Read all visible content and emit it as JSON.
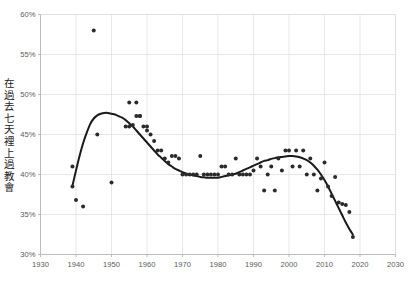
{
  "chart_data": {
    "type": "scatter",
    "title": "",
    "subtitle": "",
    "xlabel": "",
    "ylabel": "在過去七天裡上過教會",
    "xlim": [
      1930,
      2030
    ],
    "ylim": [
      30,
      60
    ],
    "xticks": [
      1930,
      1940,
      1950,
      1960,
      1970,
      1980,
      1990,
      2000,
      2010,
      2020,
      2030
    ],
    "xtick_labels": [
      "1930",
      "1940",
      "1950",
      "1960",
      "1970",
      "1980",
      "1990",
      "2000",
      "2010",
      "2020",
      "2030"
    ],
    "yticks": [
      30,
      35,
      40,
      45,
      50,
      55,
      60
    ],
    "ytick_labels": [
      "30%",
      "35%",
      "40%",
      "45%",
      "50%",
      "55%",
      "60%"
    ],
    "grid": true,
    "grid_color": "#dcdcdc",
    "legend": null,
    "legend_position": "none",
    "marker_color": "#2b2b2b",
    "marker_size": 2.0,
    "trend_color": "#1a1a1a",
    "trend_width": 2.0,
    "series": [
      {
        "name": "在過去七天裡上過教會",
        "type": "scatter",
        "points": [
          [
            1939,
            41.0
          ],
          [
            1939,
            38.5
          ],
          [
            1940,
            36.8
          ],
          [
            1942,
            36.0
          ],
          [
            1945,
            58.0
          ],
          [
            1946,
            45.0
          ],
          [
            1950,
            39.0
          ],
          [
            1954,
            46.0
          ],
          [
            1955,
            46.0
          ],
          [
            1955,
            49.0
          ],
          [
            1956,
            46.2
          ],
          [
            1957,
            49.0
          ],
          [
            1957,
            47.3
          ],
          [
            1958,
            47.3
          ],
          [
            1958,
            47.3
          ],
          [
            1959,
            46.0
          ],
          [
            1960,
            46.0
          ],
          [
            1960,
            45.5
          ],
          [
            1961,
            45.0
          ],
          [
            1962,
            44.2
          ],
          [
            1963,
            43.0
          ],
          [
            1964,
            43.0
          ],
          [
            1965,
            42.0
          ],
          [
            1966,
            41.5
          ],
          [
            1967,
            42.3
          ],
          [
            1968,
            42.3
          ],
          [
            1969,
            42.0
          ],
          [
            1970,
            40.0
          ],
          [
            1971,
            40.0
          ],
          [
            1972,
            40.0
          ],
          [
            1973,
            40.0
          ],
          [
            1974,
            40.0
          ],
          [
            1975,
            42.3
          ],
          [
            1976,
            40.0
          ],
          [
            1977,
            40.0
          ],
          [
            1978,
            40.0
          ],
          [
            1979,
            40.0
          ],
          [
            1980,
            40.0
          ],
          [
            1981,
            41.0
          ],
          [
            1982,
            41.0
          ],
          [
            1983,
            40.0
          ],
          [
            1984,
            40.0
          ],
          [
            1985,
            42.0
          ],
          [
            1986,
            40.0
          ],
          [
            1987,
            40.0
          ],
          [
            1988,
            40.0
          ],
          [
            1989,
            40.0
          ],
          [
            1990,
            40.5
          ],
          [
            1991,
            42.0
          ],
          [
            1992,
            41.0
          ],
          [
            1993,
            38.0
          ],
          [
            1994,
            40.0
          ],
          [
            1995,
            41.0
          ],
          [
            1996,
            38.0
          ],
          [
            1997,
            42.0
          ],
          [
            1998,
            40.5
          ],
          [
            1999,
            43.0
          ],
          [
            2000,
            43.0
          ],
          [
            2001,
            41.0
          ],
          [
            2002,
            43.0
          ],
          [
            2003,
            41.0
          ],
          [
            2004,
            43.0
          ],
          [
            2005,
            40.0
          ],
          [
            2006,
            42.0
          ],
          [
            2007,
            40.0
          ],
          [
            2008,
            38.0
          ],
          [
            2009,
            39.5
          ],
          [
            2010,
            41.5
          ],
          [
            2011,
            38.5
          ],
          [
            2012,
            37.3
          ],
          [
            2013,
            39.7
          ],
          [
            2014,
            36.5
          ],
          [
            2015,
            36.3
          ],
          [
            2016,
            36.2
          ],
          [
            2017,
            35.3
          ],
          [
            2018,
            32.2
          ]
        ]
      }
    ],
    "trend_line": {
      "name": "smoothed trend",
      "points": [
        [
          1939,
          38.6
        ],
        [
          1940,
          40.5
        ],
        [
          1941,
          42.3
        ],
        [
          1942,
          43.9
        ],
        [
          1943,
          45.2
        ],
        [
          1944,
          46.3
        ],
        [
          1945,
          47.0
        ],
        [
          1946,
          47.4
        ],
        [
          1947,
          47.6
        ],
        [
          1948,
          47.7
        ],
        [
          1949,
          47.7
        ],
        [
          1950,
          47.6
        ],
        [
          1951,
          47.5
        ],
        [
          1952,
          47.3
        ],
        [
          1953,
          47.1
        ],
        [
          1954,
          46.8
        ],
        [
          1955,
          46.4
        ],
        [
          1956,
          46.0
        ],
        [
          1957,
          45.5
        ],
        [
          1958,
          45.0
        ],
        [
          1959,
          44.5
        ],
        [
          1960,
          44.0
        ],
        [
          1961,
          43.5
        ],
        [
          1962,
          43.0
        ],
        [
          1963,
          42.5
        ],
        [
          1964,
          42.1
        ],
        [
          1965,
          41.7
        ],
        [
          1966,
          41.3
        ],
        [
          1967,
          41.0
        ],
        [
          1968,
          40.7
        ],
        [
          1969,
          40.5
        ],
        [
          1970,
          40.3
        ],
        [
          1971,
          40.1
        ],
        [
          1972,
          40.0
        ],
        [
          1973,
          39.9
        ],
        [
          1974,
          39.8
        ],
        [
          1975,
          39.7
        ],
        [
          1976,
          39.65
        ],
        [
          1977,
          39.6
        ],
        [
          1978,
          39.6
        ],
        [
          1979,
          39.6
        ],
        [
          1980,
          39.6
        ],
        [
          1981,
          39.7
        ],
        [
          1982,
          39.8
        ],
        [
          1983,
          39.9
        ],
        [
          1984,
          40.0
        ],
        [
          1985,
          40.1
        ],
        [
          1986,
          40.3
        ],
        [
          1987,
          40.5
        ],
        [
          1988,
          40.7
        ],
        [
          1989,
          40.9
        ],
        [
          1990,
          41.1
        ],
        [
          1991,
          41.3
        ],
        [
          1992,
          41.5
        ],
        [
          1993,
          41.7
        ],
        [
          1994,
          41.8
        ],
        [
          1995,
          41.95
        ],
        [
          1996,
          42.05
        ],
        [
          1997,
          42.15
        ],
        [
          1998,
          42.2
        ],
        [
          1999,
          42.25
        ],
        [
          2000,
          42.3
        ],
        [
          2001,
          42.3
        ],
        [
          2002,
          42.25
        ],
        [
          2003,
          42.15
        ],
        [
          2004,
          42.0
        ],
        [
          2005,
          41.8
        ],
        [
          2006,
          41.5
        ],
        [
          2007,
          41.1
        ],
        [
          2008,
          40.6
        ],
        [
          2009,
          40.0
        ],
        [
          2010,
          39.3
        ],
        [
          2011,
          38.5
        ],
        [
          2012,
          37.6
        ],
        [
          2013,
          36.7
        ],
        [
          2014,
          35.8
        ],
        [
          2015,
          34.9
        ],
        [
          2016,
          34.0
        ],
        [
          2017,
          33.2
        ],
        [
          2018,
          32.5
        ]
      ]
    }
  }
}
